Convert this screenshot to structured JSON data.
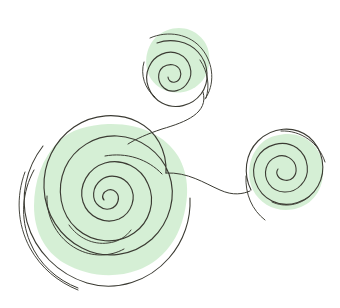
{
  "canvas": {
    "width": 340,
    "height": 308,
    "background_color": "#ffffff",
    "title": "Three connected hand-drawn spirals over pale green blobs"
  },
  "palette": {
    "background": "#ffffff",
    "blob_green": "#d3eed3",
    "blob_green_soft": "#dcf1dc",
    "ink": "#3b3b33",
    "ink_light": "#4a4a40"
  },
  "style": {
    "ink_stroke_width": 1.1,
    "ink_stroke_width_thin": 0.9,
    "blob_opacity": 0.95
  },
  "blobs": [
    {
      "name": "blob-large-bottom-left",
      "center_x": 112,
      "center_y": 198,
      "radius_x": 77,
      "radius_y": 75,
      "color": "#d3eed3"
    },
    {
      "name": "blob-top-middle",
      "center_x": 178,
      "center_y": 59,
      "radius_x": 31,
      "radius_y": 32,
      "color": "#d3eed3"
    },
    {
      "name": "blob-right",
      "center_x": 286,
      "center_y": 171,
      "radius_x": 38,
      "radius_y": 37,
      "color": "#d3eed3"
    }
  ],
  "spirals": [
    {
      "name": "spiral-large-bottom-left",
      "center_x": 98,
      "center_y": 213,
      "max_radius": 86,
      "turns": 3.1,
      "rotation_deg": 140,
      "direction": "counter-clockwise"
    },
    {
      "name": "spiral-top-middle",
      "center_x": 176,
      "center_y": 63,
      "max_radius": 34,
      "turns": 2.6,
      "rotation_deg": 200,
      "direction": "counter-clockwise"
    },
    {
      "name": "spiral-right",
      "center_x": 286,
      "center_y": 172,
      "max_radius": 42,
      "turns": 2.7,
      "rotation_deg": 30,
      "direction": "counter-clockwise"
    }
  ],
  "connectors": [
    {
      "name": "connector-top-to-large",
      "from": "spiral-top-middle",
      "to": "spiral-large-bottom-left",
      "path": "M 203 92 C 208 112, 186 122, 160 130 C 146 135, 135 140, 128 143"
    },
    {
      "name": "connector-large-to-right",
      "from": "spiral-large-bottom-left",
      "to": "spiral-right",
      "path": "M 166 173 C 188 172, 204 183, 220 190 C 233 196, 243 194, 250 191"
    }
  ],
  "stray_arcs": [
    {
      "name": "stray-arc-outer-left-1"
    },
    {
      "name": "stray-arc-outer-left-2"
    },
    {
      "name": "stray-arc-lower-left"
    },
    {
      "name": "stray-arc-right-tail"
    },
    {
      "name": "stray-arc-top-tail"
    }
  ]
}
